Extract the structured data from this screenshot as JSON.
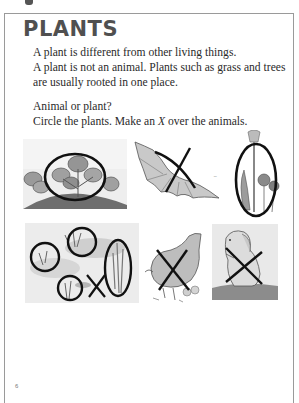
{
  "page": {
    "title": "PLANTS",
    "paragraph1": [
      "A plant is different from other living things.",
      "A plant is not an animal. Plants such as grass and trees",
      "are usually rooted in one place."
    ],
    "paragraph2": [
      "Animal or plant?",
      "Circle the plants. Make an X over the animals."
    ],
    "instruction_parts": {
      "before": "Circle the plants. Make an ",
      "italic": "X",
      "after": " over the animals."
    },
    "page_number": "6"
  },
  "illustrations": [
    {
      "subject": "leafy plant",
      "type": "plant",
      "mark": "circled"
    },
    {
      "subject": "bat",
      "type": "animal",
      "mark": "x"
    },
    {
      "subject": "tulip and flowers",
      "type": "plant",
      "mark": "circled"
    },
    {
      "subject": "pond with water plants and dragonfly",
      "type": "mixed",
      "mark": "circles and x"
    },
    {
      "subject": "hen with chicks",
      "type": "animal",
      "mark": "x"
    },
    {
      "subject": "dog",
      "type": "animal",
      "mark": "x"
    }
  ],
  "colors": {
    "title": "#505050",
    "text": "#2a2a2a",
    "frame": "#9a9a9a",
    "marker": "#111111"
  }
}
